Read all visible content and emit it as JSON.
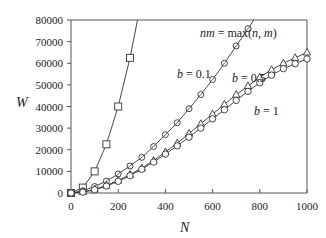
{
  "chart_data": {
    "type": "line",
    "title": "",
    "xlabel": "N",
    "ylabel": "W",
    "xlim": [
      0,
      1000
    ],
    "ylim": [
      0,
      80000
    ],
    "xticks": [
      0,
      200,
      400,
      600,
      800,
      1000
    ],
    "yticks": [
      0,
      10000,
      20000,
      30000,
      40000,
      50000,
      60000,
      70000,
      80000
    ],
    "grid": false,
    "legend": "none (inline annotations)",
    "series": [
      {
        "name": "nm = max(n,m)",
        "marker": "square",
        "x": [
          0,
          50,
          100,
          150,
          200,
          250,
          300
        ],
        "y": [
          0,
          2500,
          10000,
          22500,
          40000,
          62500,
          90000
        ]
      },
      {
        "name": "b = 0.1",
        "marker": "circle-slashed",
        "x": [
          0,
          50,
          100,
          150,
          200,
          250,
          300,
          350,
          400,
          450,
          500,
          550,
          600,
          650,
          700,
          750,
          800,
          850
        ],
        "y": [
          0,
          1000,
          3000,
          5500,
          8800,
          12500,
          16500,
          21500,
          27000,
          32500,
          39000,
          45500,
          52500,
          60000,
          68000,
          76000,
          84000,
          93000
        ]
      },
      {
        "name": "b = 0.5",
        "marker": "triangle",
        "x": [
          0,
          50,
          100,
          150,
          200,
          250,
          300,
          350,
          400,
          450,
          500,
          550,
          600,
          650,
          700,
          750,
          800,
          850,
          900,
          950,
          1000
        ],
        "y": [
          0,
          500,
          1700,
          3500,
          5800,
          8500,
          11500,
          15000,
          19000,
          23000,
          27500,
          32000,
          36500,
          41000,
          45500,
          49500,
          53500,
          57000,
          60000,
          62500,
          65000
        ]
      },
      {
        "name": "b = 1",
        "marker": "circle",
        "x": [
          0,
          50,
          100,
          150,
          200,
          250,
          300,
          350,
          400,
          450,
          500,
          550,
          600,
          650,
          700,
          750,
          800,
          850,
          900,
          950,
          1000
        ],
        "y": [
          0,
          400,
          1500,
          3200,
          5400,
          8000,
          11000,
          14300,
          18000,
          21800,
          25800,
          30000,
          34300,
          38500,
          42800,
          47000,
          51000,
          54500,
          57500,
          59800,
          62000
        ]
      }
    ],
    "annotations": [
      {
        "text": "nm = max(n, m)",
        "x": 545,
        "y": 70000
      },
      {
        "text": "b = 0.1",
        "x": 470,
        "y": 46000
      },
      {
        "text": "b = 0.5",
        "x": 720,
        "y": 44000
      },
      {
        "text": "b = 1",
        "x": 810,
        "y": 32000
      }
    ]
  },
  "axes": {
    "x_title": "N",
    "y_title": "W",
    "x_tick_labels": [
      "0",
      "200",
      "400",
      "600",
      "800",
      "1000"
    ],
    "y_tick_labels": [
      "0",
      "10000",
      "20000",
      "30000",
      "40000",
      "50000",
      "60000",
      "70000",
      "80000"
    ]
  },
  "labels": {
    "nm_max": "nm = max(n, m)",
    "b01": "b = 0.1",
    "b05": "b = 0.5",
    "b1": "b = 1"
  },
  "colors": {
    "line": "#333333",
    "axis": "#555555",
    "marker_fill": "#ffffff"
  }
}
